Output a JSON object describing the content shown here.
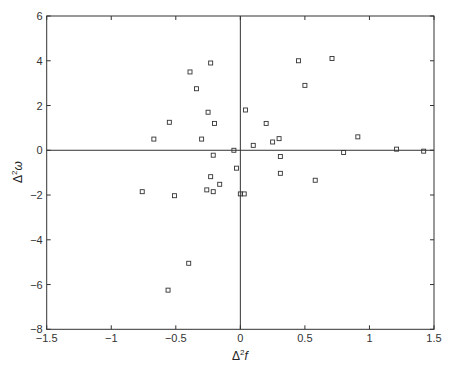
{
  "chart_data": {
    "type": "scatter",
    "title": "",
    "xlabel": "Δ²f",
    "ylabel": "Δ²ω",
    "xlim": [
      -1.5,
      1.5
    ],
    "ylim": [
      -8,
      6
    ],
    "xticks": [
      -1.5,
      -1,
      -0.5,
      0,
      0.5,
      1,
      1.5
    ],
    "xtick_labels": [
      "−1.5",
      "−1",
      "−0.5",
      "0",
      "0.5",
      "1",
      "1.5"
    ],
    "yticks": [
      -8,
      -6,
      -4,
      -2,
      0,
      2,
      4,
      6
    ],
    "ytick_labels": [
      "−8",
      "−6",
      "−4",
      "−2",
      "0",
      "2",
      "4",
      "6"
    ],
    "grid": false,
    "zero_lines": true,
    "legend": null,
    "marker": "square-open",
    "series": [
      {
        "name": "points",
        "x": [
          -0.23,
          -0.39,
          -0.34,
          -0.25,
          -0.2,
          -0.55,
          -0.67,
          -0.3,
          -0.05,
          -0.21,
          -0.03,
          -0.23,
          -0.16,
          -0.26,
          -0.21,
          -0.76,
          -0.51,
          0.0,
          -0.4,
          -0.56,
          0.03,
          0.45,
          0.71,
          0.5,
          0.04,
          0.2,
          0.1,
          0.25,
          0.3,
          0.31,
          0.31,
          0.58,
          0.8,
          0.91,
          1.21,
          1.42
        ],
        "y": [
          3.9,
          3.5,
          2.75,
          1.7,
          1.2,
          1.25,
          0.5,
          0.5,
          0.0,
          -0.22,
          -0.8,
          -1.18,
          -1.52,
          -1.77,
          -1.85,
          -1.85,
          -2.03,
          -1.95,
          -5.05,
          -6.25,
          -1.95,
          4.0,
          4.1,
          2.9,
          1.8,
          1.2,
          0.22,
          0.37,
          0.52,
          -0.28,
          -1.03,
          -1.34,
          -0.1,
          0.6,
          0.05,
          -0.04
        ]
      }
    ]
  },
  "style": {
    "axis_color": "#333333",
    "marker_color": "#333333",
    "background": "#ffffff"
  }
}
